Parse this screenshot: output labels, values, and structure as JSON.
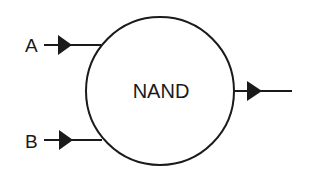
{
  "diagram": {
    "gate": {
      "label": "NAND",
      "shape": "circle",
      "center": [
        160,
        91
      ],
      "radius": 75
    },
    "inputs": [
      {
        "label": "A",
        "y": 45
      },
      {
        "label": "B",
        "y": 140
      }
    ],
    "output": {
      "label": "",
      "y": 91
    },
    "colors": {
      "stroke": "#1a1a1a",
      "background": "#ffffff"
    }
  }
}
